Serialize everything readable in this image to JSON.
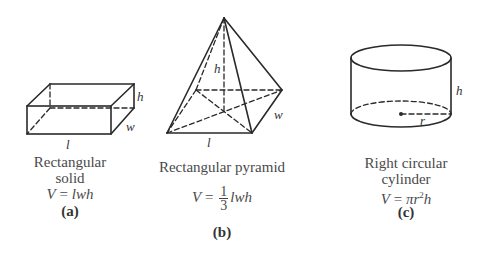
{
  "figures": [
    {
      "id": "a",
      "name": "rectangular-solid",
      "title_line1": "Rectangular",
      "title_line2": "solid",
      "formula_lhs": "V",
      "formula_eq": " = ",
      "formula_rhs": "lwh",
      "tag": "(a)",
      "dim_labels": {
        "length": "l",
        "width": "w",
        "height": "h"
      }
    },
    {
      "id": "b",
      "name": "rectangular-pyramid",
      "title": "Rectangular pyramid",
      "formula_lhs": "V",
      "formula_eq": " = ",
      "formula_num": "1",
      "formula_den": "3",
      "formula_rhs": "lwh",
      "tag": "(b)",
      "dim_labels": {
        "length": "l",
        "width": "w",
        "height": "h"
      }
    },
    {
      "id": "c",
      "name": "right-circular-cylinder",
      "title_line1": "Right circular",
      "title_line2": "cylinder",
      "formula_lhs": "V",
      "formula_eq": " = ",
      "formula_pi": "π",
      "formula_r": "r",
      "formula_exp": "2",
      "formula_h": "h",
      "tag": "(c)",
      "dim_labels": {
        "radius": "r",
        "height": "h"
      }
    }
  ],
  "colors": {
    "stroke": "#2a2a2a",
    "text": "#4a4a4a"
  }
}
